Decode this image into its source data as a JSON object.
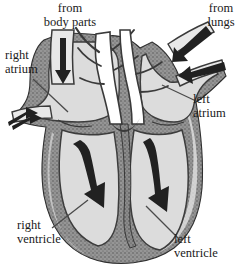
{
  "figure": {
    "width": 244,
    "height": 269,
    "background_color": "#ffffff",
    "style": "grayscale stippled anatomical line illustration"
  },
  "labels": {
    "from_body_parts": "from\nbody parts",
    "from_lungs": "from\nlungs",
    "right_atrium": "right\natrium",
    "left_atrium": "left\natrium",
    "right_ventricle": "right\nventricle",
    "left_ventricle": "left\nventricle"
  },
  "colors": {
    "chamber_fill": "#dcdcdc",
    "wall_dark": "#4a4a4a",
    "wall_mid": "#6e6e6e",
    "wall_light": "#b8b8b8",
    "arrow_fill": "#2a2a2a",
    "outline": "#3d3d3d",
    "text": "#1a1a1a",
    "leader_line": "#4a4a4a"
  },
  "arrows": [
    {
      "name": "superior-vena-cava-inflow",
      "direction": "down",
      "chamber": "right atrium",
      "size": "small"
    },
    {
      "name": "inferior-vena-cava-inflow",
      "direction": "right",
      "chamber": "right atrium",
      "size": "small"
    },
    {
      "name": "pulmonary-vein-upper-inflow",
      "direction": "down-left",
      "chamber": "left atrium",
      "size": "small"
    },
    {
      "name": "pulmonary-vein-lower-inflow",
      "direction": "left",
      "chamber": "left atrium",
      "size": "small"
    },
    {
      "name": "right-ventricle-flow",
      "direction": "down",
      "chamber": "right ventricle",
      "size": "large"
    },
    {
      "name": "left-ventricle-flow",
      "direction": "down",
      "chamber": "left ventricle",
      "size": "large"
    }
  ],
  "leader_lines": [
    {
      "name": "leader-right-atrium",
      "from": "right atrium label",
      "to": "right atrium chamber"
    },
    {
      "name": "leader-left-atrium",
      "from": "left atrium label",
      "to": "left atrium chamber"
    },
    {
      "name": "leader-right-ventricle",
      "from": "right ventricle label",
      "to": "right ventricle chamber"
    },
    {
      "name": "leader-left-ventricle",
      "from": "left ventricle label",
      "to": "left ventricle chamber"
    }
  ]
}
